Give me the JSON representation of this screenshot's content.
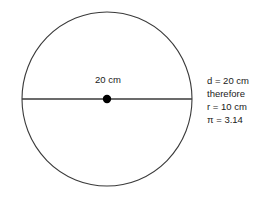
{
  "figure": {
    "type": "circle-diagram",
    "background_color": "#ffffff",
    "stroke_color": "#3a3a3a",
    "text_color": "#1a1a1a",
    "circle": {
      "name": "circle-outline",
      "center_x": 107,
      "center_y": 99,
      "radius_x": 85,
      "radius_y": 87,
      "stroke_width": 1.1
    },
    "diameter_line": {
      "name": "diameter-line",
      "x1": 22,
      "y1": 99,
      "x2": 192,
      "y2": 99,
      "stroke_width": 1.4
    },
    "center_dot": {
      "name": "center-point",
      "cx": 107,
      "cy": 99,
      "r": 4.2,
      "fill": "#000000"
    },
    "diameter_label": "20 cm"
  },
  "notes": {
    "lines": [
      "d = 20 cm",
      "therefore",
      "r = 10 cm",
      "π = 3.14"
    ],
    "line_0": "d = 20 cm",
    "line_1": "therefore",
    "line_2": "r = 10 cm",
    "line_3": "π = 3.14"
  }
}
